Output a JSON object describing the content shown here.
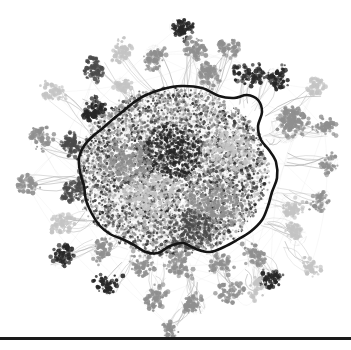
{
  "figure": {
    "type": "network-graph",
    "title": "",
    "background_color": "#ffffff",
    "width": 351,
    "height": 350,
    "rule": {
      "visible": true,
      "y": 337,
      "thickness": 3,
      "color": "#1a1a1a",
      "full_width": true
    },
    "hull": {
      "label": "",
      "stroke_color": "#141414",
      "stroke_width": 2.6,
      "fill": "none",
      "description": "closed hand-drawn contour enclosing the dense core"
    },
    "palette": {
      "background": "#ffffff",
      "edge_light": "#c8c8c8",
      "edge_mid": "#a8a8a8",
      "node_light": "#c4c4c4",
      "node_mid": "#8f8f8f",
      "node_dark": "#4a4a4a",
      "node_darkest": "#262626",
      "contour": "#141414",
      "rule": "#1a1a1a"
    }
  },
  "chart_data": {
    "type": "scatter",
    "title": "",
    "subtitle": "",
    "xlabel": "",
    "ylabel": "",
    "xlim": [
      0,
      351
    ],
    "ylim": [
      0,
      350
    ],
    "grid": false,
    "legend": null,
    "annotations": [],
    "core": {
      "center": [
        172,
        172
      ],
      "radius_x": 96,
      "radius_y": 83,
      "node_count": 5200,
      "dense_patches": [
        {
          "cx": 172,
          "cy": 152,
          "r": 30,
          "shade": "node_darkest",
          "count": 420
        },
        {
          "cx": 150,
          "cy": 195,
          "r": 26,
          "shade": "node_light",
          "count": 330
        },
        {
          "cx": 215,
          "cy": 205,
          "r": 28,
          "shade": "node_mid",
          "count": 340
        },
        {
          "cx": 128,
          "cy": 160,
          "r": 24,
          "shade": "node_mid",
          "count": 260
        },
        {
          "cx": 230,
          "cy": 150,
          "r": 22,
          "shade": "node_light",
          "count": 240
        },
        {
          "cx": 190,
          "cy": 230,
          "r": 22,
          "shade": "node_dark",
          "count": 250
        }
      ]
    },
    "hull_points": [
      [
        163,
        89
      ],
      [
        181,
        86
      ],
      [
        202,
        88
      ],
      [
        219,
        96
      ],
      [
        234,
        98
      ],
      [
        247,
        95
      ],
      [
        258,
        100
      ],
      [
        262,
        112
      ],
      [
        258,
        126
      ],
      [
        261,
        140
      ],
      [
        269,
        150
      ],
      [
        276,
        162
      ],
      [
        277,
        178
      ],
      [
        272,
        192
      ],
      [
        268,
        206
      ],
      [
        262,
        220
      ],
      [
        250,
        232
      ],
      [
        237,
        240
      ],
      [
        224,
        247
      ],
      [
        210,
        252
      ],
      [
        196,
        249
      ],
      [
        183,
        243
      ],
      [
        170,
        246
      ],
      [
        158,
        253
      ],
      [
        146,
        252
      ],
      [
        134,
        245
      ],
      [
        122,
        239
      ],
      [
        110,
        234
      ],
      [
        100,
        226
      ],
      [
        92,
        214
      ],
      [
        86,
        200
      ],
      [
        84,
        186
      ],
      [
        80,
        172
      ],
      [
        79,
        158
      ],
      [
        84,
        146
      ],
      [
        93,
        136
      ],
      [
        103,
        128
      ],
      [
        112,
        120
      ],
      [
        122,
        112
      ],
      [
        133,
        103
      ],
      [
        146,
        95
      ]
    ],
    "satellites": [
      {
        "id": "s01",
        "cx": 179,
        "cy": 27,
        "r": 12,
        "shade": "node_darkest",
        "n": 70,
        "linked_to": null
      },
      {
        "id": "s02",
        "cx": 121,
        "cy": 53,
        "r": 12,
        "shade": "node_light",
        "n": 65,
        "linked_to": [
          160,
          100
        ]
      },
      {
        "id": "s03",
        "cx": 155,
        "cy": 55,
        "r": 13,
        "shade": "node_mid",
        "n": 72,
        "linked_to": [
          168,
          100
        ]
      },
      {
        "id": "s04",
        "cx": 196,
        "cy": 52,
        "r": 13,
        "shade": "node_mid",
        "n": 74,
        "linked_to": [
          186,
          98
        ]
      },
      {
        "id": "s05",
        "cx": 226,
        "cy": 51,
        "r": 12,
        "shade": "node_mid",
        "n": 66,
        "linked_to": [
          204,
          100
        ]
      },
      {
        "id": "s06",
        "cx": 95,
        "cy": 70,
        "r": 13,
        "shade": "node_dark",
        "n": 78,
        "linked_to": [
          140,
          108
        ]
      },
      {
        "id": "s07",
        "cx": 207,
        "cy": 78,
        "r": 14,
        "shade": "node_mid",
        "n": 84,
        "linked_to": [
          206,
          98
        ]
      },
      {
        "id": "s08",
        "cx": 248,
        "cy": 74,
        "r": 13,
        "shade": "node_darkest",
        "n": 72,
        "linked_to": [
          240,
          102
        ]
      },
      {
        "id": "s09",
        "cx": 276,
        "cy": 77,
        "r": 12,
        "shade": "node_darkest",
        "n": 64,
        "linked_to": [
          255,
          104
        ]
      },
      {
        "id": "s10",
        "cx": 315,
        "cy": 88,
        "r": 11,
        "shade": "node_light",
        "n": 52,
        "linked_to": [
          272,
          118
        ]
      },
      {
        "id": "s11",
        "cx": 54,
        "cy": 92,
        "r": 11,
        "shade": "node_light",
        "n": 54,
        "linked_to": [
          96,
          132
        ]
      },
      {
        "id": "s12",
        "cx": 92,
        "cy": 108,
        "r": 13,
        "shade": "node_darkest",
        "n": 80,
        "linked_to": [
          118,
          124
        ]
      },
      {
        "id": "s13",
        "cx": 285,
        "cy": 128,
        "r": 19,
        "shade": "node_mid",
        "n": 150,
        "linked_to": [
          268,
          140
        ]
      },
      {
        "id": "s14",
        "cx": 324,
        "cy": 128,
        "r": 11,
        "shade": "node_mid",
        "n": 50,
        "linked_to": [
          295,
          132
        ]
      },
      {
        "id": "s15",
        "cx": 39,
        "cy": 140,
        "r": 12,
        "shade": "node_mid",
        "n": 58,
        "linked_to": [
          82,
          158
        ]
      },
      {
        "id": "s16",
        "cx": 72,
        "cy": 143,
        "r": 13,
        "shade": "node_dark",
        "n": 76,
        "linked_to": [
          92,
          150
        ]
      },
      {
        "id": "s17",
        "cx": 330,
        "cy": 164,
        "r": 10,
        "shade": "node_mid",
        "n": 44,
        "linked_to": [
          290,
          158
        ]
      },
      {
        "id": "s18",
        "cx": 27,
        "cy": 183,
        "r": 12,
        "shade": "node_mid",
        "n": 56,
        "linked_to": [
          80,
          180
        ]
      },
      {
        "id": "s19",
        "cx": 75,
        "cy": 192,
        "r": 12,
        "shade": "node_dark",
        "n": 70,
        "linked_to": [
          90,
          190
        ]
      },
      {
        "id": "s20",
        "cx": 322,
        "cy": 199,
        "r": 11,
        "shade": "node_mid",
        "n": 48,
        "linked_to": [
          283,
          190
        ]
      },
      {
        "id": "s21",
        "cx": 291,
        "cy": 205,
        "r": 13,
        "shade": "node_light",
        "n": 62,
        "linked_to": [
          272,
          200
        ]
      },
      {
        "id": "s22",
        "cx": 62,
        "cy": 222,
        "r": 12,
        "shade": "node_light",
        "n": 58,
        "linked_to": [
          92,
          214
        ]
      },
      {
        "id": "s23",
        "cx": 297,
        "cy": 236,
        "r": 12,
        "shade": "node_light",
        "n": 58,
        "linked_to": [
          266,
          224
        ]
      },
      {
        "id": "s24",
        "cx": 100,
        "cy": 253,
        "r": 12,
        "shade": "node_mid",
        "n": 60,
        "linked_to": [
          122,
          244
        ]
      },
      {
        "id": "s25",
        "cx": 145,
        "cy": 265,
        "r": 12,
        "shade": "node_mid",
        "n": 62,
        "linked_to": [
          150,
          252
        ]
      },
      {
        "id": "s26",
        "cx": 182,
        "cy": 268,
        "r": 12,
        "shade": "node_mid",
        "n": 62,
        "linked_to": [
          185,
          248
        ]
      },
      {
        "id": "s27",
        "cx": 220,
        "cy": 262,
        "r": 12,
        "shade": "node_mid",
        "n": 60,
        "linked_to": [
          212,
          251
        ]
      },
      {
        "id": "s28",
        "cx": 254,
        "cy": 258,
        "r": 12,
        "shade": "node_mid",
        "n": 60,
        "linked_to": [
          240,
          242
        ]
      },
      {
        "id": "s29",
        "cx": 60,
        "cy": 258,
        "r": 13,
        "shade": "node_darkest",
        "n": 66,
        "linked_to": [
          100,
          240
        ]
      },
      {
        "id": "s30",
        "cx": 108,
        "cy": 286,
        "r": 12,
        "shade": "node_darkest",
        "n": 58,
        "linked_to": [
          128,
          260
        ]
      },
      {
        "id": "s31",
        "cx": 154,
        "cy": 297,
        "r": 12,
        "shade": "node_mid",
        "n": 58,
        "linked_to": [
          160,
          270
        ]
      },
      {
        "id": "s32",
        "cx": 196,
        "cy": 305,
        "r": 12,
        "shade": "node_mid",
        "n": 58,
        "linked_to": [
          190,
          275
        ]
      },
      {
        "id": "s33",
        "cx": 233,
        "cy": 292,
        "r": 12,
        "shade": "node_mid",
        "n": 56,
        "linked_to": [
          222,
          266
        ]
      },
      {
        "id": "s34",
        "cx": 272,
        "cy": 278,
        "r": 12,
        "shade": "node_darkest",
        "n": 58,
        "linked_to": [
          258,
          260
        ]
      },
      {
        "id": "s35",
        "cx": 170,
        "cy": 327,
        "r": 10,
        "shade": "node_mid",
        "n": 40,
        "linked_to": [
          186,
          305
        ]
      },
      {
        "id": "s36",
        "cx": 310,
        "cy": 268,
        "r": 10,
        "shade": "node_light",
        "n": 40,
        "linked_to": [
          290,
          244
        ]
      },
      {
        "id": "s37",
        "cx": 258,
        "cy": 290,
        "r": 10,
        "shade": "node_light",
        "n": 38,
        "linked_to": [
          252,
          268
        ]
      },
      {
        "id": "s38",
        "cx": 122,
        "cy": 84,
        "r": 10,
        "shade": "node_light",
        "n": 40,
        "linked_to": [
          138,
          106
        ]
      }
    ],
    "values": [],
    "categories": []
  }
}
